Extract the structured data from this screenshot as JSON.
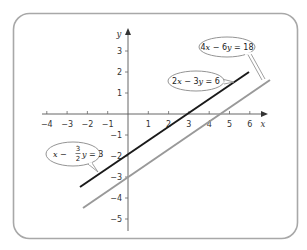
{
  "diagram": {
    "frame": {
      "border_color": "#a8a8a8"
    },
    "axes": {
      "x_label": "x",
      "y_label": "y",
      "x_ticks": [
        -4,
        -3,
        -2,
        -1,
        1,
        2,
        3,
        4,
        5,
        6
      ],
      "x_tick_labels": [
        "−4",
        "−3",
        "−2",
        "−1",
        "1",
        "2",
        "3",
        "4",
        "5",
        "6"
      ],
      "y_ticks": [
        3,
        2,
        1,
        -1,
        -2,
        -3,
        -4,
        -5
      ],
      "y_tick_labels": [
        "3",
        "2",
        "1",
        "−1",
        "−2",
        "−3",
        "−4",
        "−5"
      ],
      "xlim": [
        -4.3,
        6.6
      ],
      "ylim": [
        -5.6,
        4.1
      ]
    },
    "lines": [
      {
        "name": "line-2x-3y-6",
        "equation": "2x − 3y = 6",
        "equivalent": "x − (3/2)y = 3",
        "color": "#1a1a1a",
        "from": [
          -2.3,
          -3.5
        ],
        "to": [
          6,
          2
        ]
      },
      {
        "name": "line-4x-6y-18",
        "equation": "4x − 6y = 18",
        "color": "#999999",
        "from": [
          -2.2,
          -4.5
        ],
        "to": [
          6.9,
          1.6
        ]
      }
    ],
    "callouts": [
      {
        "name": "callout-4x-6y-18",
        "parts": [
          "4",
          "x",
          " − 6",
          "y",
          " = 18"
        ]
      },
      {
        "name": "callout-2x-3y-6",
        "parts": [
          "2",
          "x",
          " − 3",
          "y",
          " = 6"
        ]
      },
      {
        "name": "callout-x-3-2y-3",
        "parts": [
          "x",
          " − ",
          "3",
          "2",
          "y",
          " = 3"
        ]
      }
    ]
  }
}
